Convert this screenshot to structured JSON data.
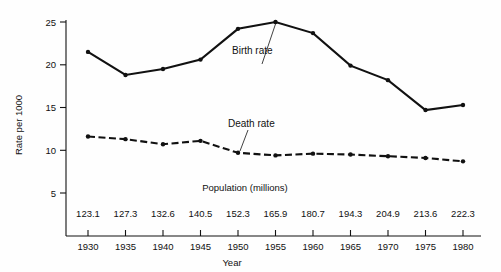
{
  "chart_data": {
    "type": "line",
    "title": "",
    "xlabel": "Year",
    "ylabel": "Rate per 1000",
    "secondary_axis_label": "Population (millions)",
    "x": [
      1930,
      1935,
      1940,
      1945,
      1950,
      1955,
      1960,
      1965,
      1970,
      1975,
      1980
    ],
    "categories": [
      "1930",
      "1935",
      "1940",
      "1945",
      "1950",
      "1955",
      "1960",
      "1965",
      "1970",
      "1975",
      "1980"
    ],
    "population_millions": [
      "123.1",
      "127.3",
      "132.6",
      "140.5",
      "152.3",
      "165.9",
      "180.7",
      "194.3",
      "204.9",
      "213.6",
      "222.3"
    ],
    "ylim": [
      0,
      25
    ],
    "yticks": [
      "5",
      "10",
      "15",
      "20",
      "25"
    ],
    "ytick_values": [
      5,
      10,
      15,
      20,
      25
    ],
    "grid": false,
    "legend_position": "inline-annotation",
    "series": [
      {
        "name": "Birth rate",
        "style": "solid",
        "values": [
          21.5,
          18.8,
          19.5,
          20.6,
          24.2,
          25.0,
          23.7,
          19.9,
          18.2,
          14.7,
          15.3
        ]
      },
      {
        "name": "Death rate",
        "style": "dashed",
        "values": [
          11.6,
          11.3,
          10.7,
          11.1,
          9.7,
          9.4,
          9.6,
          9.5,
          9.3,
          9.1,
          8.7
        ]
      }
    ],
    "annotations": [
      {
        "text": "Birth rate",
        "points_to_year": 1955
      },
      {
        "text": "Death rate",
        "points_to_year": 1945
      }
    ]
  }
}
